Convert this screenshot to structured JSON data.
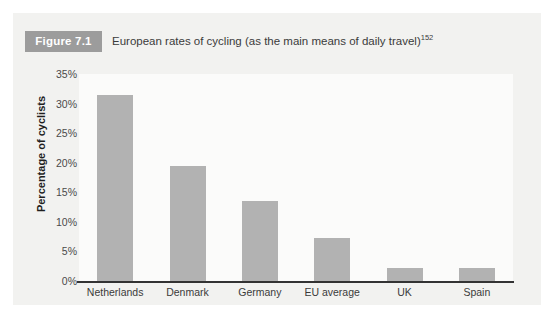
{
  "figure": {
    "badge_label": "Figure 7.1",
    "caption": "European rates of cycling (as the main means of daily travel)",
    "caption_superscript": "152"
  },
  "colors": {
    "badge_background": "#9c9c9c",
    "panel_background": "#f2f2f0",
    "plot_background": "#fbfbfa",
    "bar_fill": "#b2b2b2",
    "axis_line": "#333333",
    "text": "#3b3b3b"
  },
  "chart_data": {
    "type": "bar",
    "title": "European rates of cycling (as the main means of daily travel)",
    "xlabel": "",
    "ylabel": "Percentage of cyclists",
    "categories": [
      "Netherlands",
      "Denmark",
      "Germany",
      "EU average",
      "UK",
      "Spain"
    ],
    "values": [
      31.5,
      19.5,
      13.5,
      7.3,
      2.2,
      2.2
    ],
    "ylim": [
      0,
      35
    ],
    "ytick_values": [
      0,
      5,
      10,
      15,
      20,
      25,
      30,
      35
    ],
    "ytick_labels": [
      "0%",
      "5%",
      "10%",
      "15%",
      "20%",
      "25%",
      "30%",
      "35%"
    ],
    "grid": false,
    "legend": null,
    "series": [
      {
        "name": "Percentage of cyclists",
        "values": [
          31.5,
          19.5,
          13.5,
          7.3,
          2.2,
          2.2
        ]
      }
    ]
  }
}
